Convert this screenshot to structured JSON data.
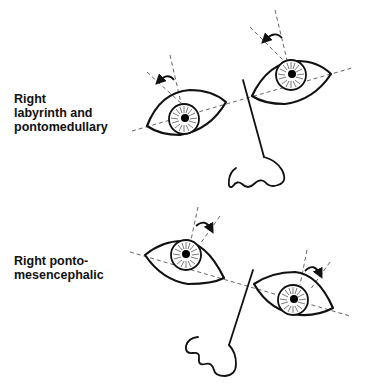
{
  "figure": {
    "panels": [
      {
        "id": "top",
        "label": "Right\nlabyrinth and\npontomedullary",
        "description": "Ocular tilt: right eye (viewer's left) lower, both eyes torted counterclockwise",
        "torsion_direction": "counterclockwise"
      },
      {
        "id": "bottom",
        "label": "Right ponto-\nmesencephalic",
        "description": "Ocular tilt: right eye (viewer's left) higher, both eyes torted clockwise",
        "torsion_direction": "clockwise"
      }
    ],
    "icons": [
      "eye-icon",
      "nose-icon",
      "torsion-arrow-icon"
    ],
    "colors": {
      "line": "#111111",
      "dashed_axis": "#555555",
      "background": "#ffffff"
    }
  }
}
